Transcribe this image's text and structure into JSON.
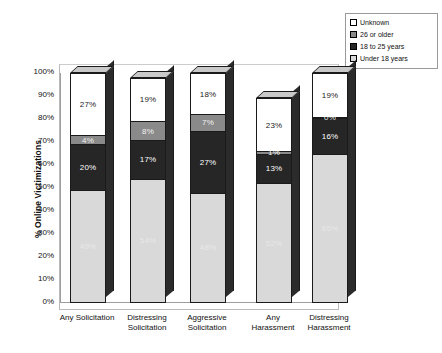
{
  "chart_data": {
    "type": "bar",
    "subtype": "stacked-column-100-3d",
    "title": "",
    "xlabel": "",
    "ylabel": "% Online Victimizations",
    "ylim": [
      0,
      100
    ],
    "ytick_labels": [
      "100%",
      "90%",
      "80%",
      "70%",
      "60%",
      "50%",
      "40%",
      "30%",
      "20%",
      "10%",
      "0%"
    ],
    "ytick_values": [
      100,
      90,
      80,
      70,
      60,
      50,
      40,
      30,
      20,
      10,
      0
    ],
    "grid": false,
    "legend_position": "top-right",
    "categories": [
      "Any Solicitation",
      "Distressing Solicitation",
      "Aggressive Solicitation",
      "Any Harassment",
      "Distressing Harassment"
    ],
    "series": [
      {
        "name": "Under 18 years",
        "color": "#d9d9d9",
        "label_color": "#e8e8e8",
        "values": [
          49,
          54,
          48,
          52,
          65
        ]
      },
      {
        "name": "18 to 25 years",
        "color": "#262626",
        "label_color": "#ffffff",
        "values": [
          20,
          17,
          27,
          13,
          16
        ]
      },
      {
        "name": "26 or older",
        "color": "#8a8a8a",
        "label_color": "#f2f2f2",
        "values": [
          4,
          8,
          7,
          1,
          0
        ]
      },
      {
        "name": "Unknown",
        "color": "#ffffff",
        "label_color": "#222222",
        "values": [
          27,
          19,
          18,
          23,
          19
        ]
      }
    ],
    "value_labels": [
      [
        "49%",
        "20%",
        "4%",
        "27%"
      ],
      [
        "54%",
        "17%",
        "8%",
        "19%"
      ],
      [
        "48%",
        "27%",
        "7%",
        "18%"
      ],
      [
        "52%",
        "13%",
        "1%",
        "23%"
      ],
      [
        "65%",
        "16%",
        "0%",
        "19%"
      ]
    ]
  },
  "legend": {
    "items": [
      {
        "label": "Unknown",
        "swatch": "#ffffff"
      },
      {
        "label": "26 or older",
        "swatch": "#8a8a8a"
      },
      {
        "label": "18 to 25 years",
        "swatch": "#262626"
      },
      {
        "label": "Under 18 years",
        "swatch": "#d9d9d9"
      }
    ]
  },
  "axis": {
    "y_title": "% Online Victimizations"
  },
  "x_labels": [
    [
      "Any Solicitation"
    ],
    [
      "Distressing",
      "Solicitation"
    ],
    [
      "Aggressive",
      "Solicitation"
    ],
    [
      "Any",
      "Harassment"
    ],
    [
      "Distressing",
      "Harassment"
    ]
  ]
}
